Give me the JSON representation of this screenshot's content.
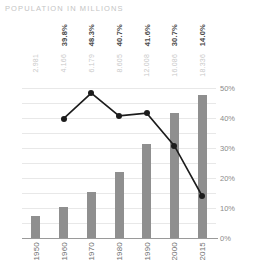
{
  "chart_data": {
    "type": "bar",
    "title": "POPULATION IN MILLIONS",
    "xlabel": "",
    "ylabel": "",
    "grid": true,
    "legend": "none",
    "categories": [
      "1950",
      "1960",
      "1970",
      "1980",
      "1990",
      "2000",
      "2015"
    ],
    "left_axis": {
      "ylim": [
        0,
        20
      ],
      "ticks": [
        "0",
        "2",
        "4",
        "6",
        "8",
        "10",
        "12",
        "14",
        "16",
        "18",
        "20"
      ],
      "tick_values": [
        0,
        2,
        4,
        6,
        8,
        10,
        12,
        14,
        16,
        18,
        20
      ]
    },
    "right_axis": {
      "ylim": [
        0,
        50
      ],
      "ticks": [
        "0%",
        "10%",
        "20%",
        "30%",
        "40%",
        "50%"
      ],
      "tick_values": [
        0,
        10,
        20,
        30,
        40,
        50
      ]
    },
    "series": [
      {
        "name": "Population (millions)",
        "type": "bar",
        "axis": "left",
        "color": "#8f8f8f",
        "values": [
          3.0,
          4.2,
          6.2,
          8.8,
          12.6,
          16.7,
          19.1
        ],
        "point_labels": [
          "2.981",
          "4.166",
          "6.179",
          "8.605",
          "12.008",
          "16.086",
          "18.336"
        ]
      },
      {
        "name": "Share (percent)",
        "type": "line",
        "axis": "right",
        "color": "#1c1c1c",
        "x": [
          "1960",
          "1970",
          "1980",
          "1990",
          "2000",
          "2015"
        ],
        "values": [
          39.8,
          48.3,
          40.7,
          41.6,
          30.7,
          14.0
        ],
        "point_labels": [
          "39.8%",
          "48.3%",
          "40.7%",
          "41.6%",
          "30.7%",
          "14.0%"
        ]
      }
    ]
  }
}
